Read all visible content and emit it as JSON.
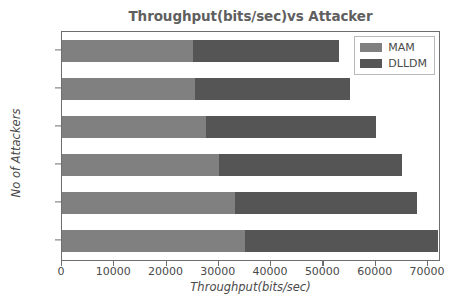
{
  "chart_data": {
    "type": "bar",
    "orientation": "horizontal",
    "stacked": true,
    "title": "Throughput(bits/sec)vs Attacker",
    "xlabel": "Throughput(bits/sec)",
    "ylabel": "No of Attackers",
    "categories": [
      "0",
      "10",
      "15",
      "20",
      "25",
      "30"
    ],
    "series": [
      {
        "name": "MAM",
        "color": "#808080",
        "values": [
          35000,
          33000,
          30000,
          27500,
          25500,
          25000
        ]
      },
      {
        "name": "DLLDM",
        "color": "#555555",
        "values": [
          37000,
          35000,
          35000,
          32500,
          29500,
          28000
        ]
      }
    ],
    "totals": [
      72000,
      68000,
      65000,
      60000,
      55000,
      53000
    ],
    "xlim": [
      0,
      72500
    ],
    "ylim": [
      -1,
      32
    ],
    "xticks": [
      0,
      10000,
      20000,
      30000,
      40000,
      50000,
      60000,
      70000
    ],
    "xtick_labels": [
      "0",
      "10000",
      "20000",
      "30000",
      "40000",
      "50000",
      "60000",
      "70000"
    ],
    "yticks": [
      0,
      10,
      15,
      20,
      25,
      30
    ],
    "ytick_labels": [
      "0",
      "10",
      "15",
      "20",
      "25",
      "30"
    ],
    "grid": false,
    "legend_position": "upper right",
    "legend_entries": [
      "MAM",
      "DLLDM"
    ]
  },
  "legend": {
    "items": [
      {
        "label": "MAM",
        "color": "#808080"
      },
      {
        "label": "DLLDM",
        "color": "#555555"
      }
    ]
  },
  "colors": {
    "mam": "#808080",
    "dlldm": "#555555",
    "axis": "#6e6e6e",
    "text": "#4a4a4a",
    "title": "#5f5f5f",
    "background": "#ffffff"
  }
}
